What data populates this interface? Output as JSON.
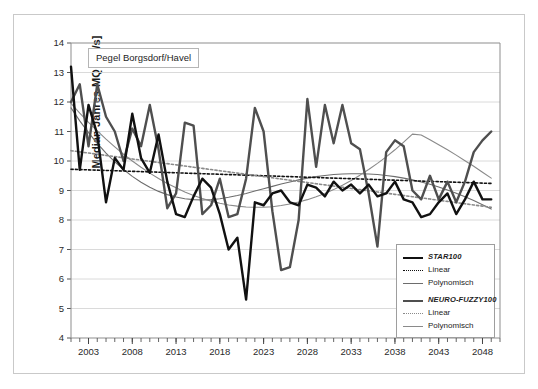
{
  "figure": {
    "title_box": "Pegel Borgsdorf/Havel",
    "frame_color": "#c9c9c9",
    "background": "#ffffff"
  },
  "legend": {
    "items": [
      {
        "key": "star-solid",
        "label": "STAR100",
        "style": "bold-italic",
        "color": "#111111"
      },
      {
        "key": "star-linear",
        "label": "Linear",
        "style": "normal",
        "color": "#111111"
      },
      {
        "key": "star-poly",
        "label": "Polynomisch",
        "style": "normal",
        "color": "#6d6d6d"
      },
      {
        "key": "nf-solid",
        "label": "NEURO-FUZZY100",
        "style": "bold-italic",
        "color": "#4f4f4f"
      },
      {
        "key": "nf-linear",
        "label": "Linear",
        "style": "normal",
        "color": "#8a8a8a"
      },
      {
        "key": "nf-poly",
        "label": "Polynomisch",
        "style": "normal",
        "color": "#8a8a8a"
      }
    ]
  },
  "chart_data": {
    "type": "line",
    "title": "Pegel Borgsdorf/Havel",
    "xlabel": "",
    "ylabel": "Median Jahres-MQ [m³/s]",
    "xlim": [
      2001,
      2050
    ],
    "ylim": [
      4,
      14
    ],
    "yticks": [
      4,
      5,
      6,
      7,
      8,
      9,
      10,
      11,
      12,
      13,
      14
    ],
    "xticks_major": [
      2003,
      2008,
      2013,
      2018,
      2023,
      2028,
      2033,
      2038,
      2043,
      2048
    ],
    "xtick_minor_step": 1,
    "grid": "horizontal",
    "legend_position": "lower-right",
    "x": [
      2001,
      2002,
      2003,
      2004,
      2005,
      2006,
      2007,
      2008,
      2009,
      2010,
      2011,
      2012,
      2013,
      2014,
      2015,
      2016,
      2017,
      2018,
      2019,
      2020,
      2021,
      2022,
      2023,
      2024,
      2025,
      2026,
      2027,
      2028,
      2029,
      2030,
      2031,
      2032,
      2033,
      2034,
      2035,
      2036,
      2037,
      2038,
      2039,
      2040,
      2041,
      2042,
      2043,
      2044,
      2045,
      2046,
      2047,
      2048,
      2049
    ],
    "series": [
      {
        "name": "STAR100",
        "style": "solid",
        "width": 2.4,
        "color": "#111111",
        "values": [
          13.2,
          9.7,
          11.9,
          10.9,
          8.6,
          10.1,
          9.7,
          11.6,
          10.1,
          9.6,
          10.9,
          9.3,
          8.2,
          8.1,
          8.8,
          9.4,
          9.1,
          8.2,
          7.0,
          7.4,
          5.3,
          8.6,
          8.5,
          8.9,
          9.0,
          8.6,
          8.5,
          9.2,
          9.1,
          8.8,
          9.3,
          9.0,
          9.2,
          8.9,
          9.2,
          8.8,
          8.9,
          9.3,
          8.7,
          8.6,
          8.1,
          8.2,
          8.6,
          8.9,
          8.2,
          8.7,
          9.3,
          8.7,
          8.7
        ]
      },
      {
        "name": "NEURO-FUZZY100",
        "style": "solid",
        "width": 2.4,
        "color": "#4f4f4f",
        "values": [
          12.0,
          12.6,
          10.5,
          12.6,
          11.5,
          11.0,
          10.0,
          11.1,
          10.5,
          11.9,
          10.4,
          8.4,
          8.9,
          11.3,
          11.2,
          8.2,
          8.5,
          9.4,
          8.1,
          8.2,
          9.4,
          11.8,
          11.0,
          8.3,
          6.3,
          6.4,
          8.0,
          12.1,
          9.8,
          11.9,
          10.6,
          11.9,
          10.6,
          10.4,
          8.9,
          7.1,
          10.3,
          10.7,
          10.5,
          9.0,
          8.7,
          9.5,
          8.7,
          9.3,
          8.6,
          9.3,
          10.3,
          10.7,
          11.0
        ]
      },
      {
        "name": "STAR100 Linear",
        "style": "dotted",
        "width": 1.6,
        "color": "#111111",
        "values": [
          9.72,
          9.71,
          9.7,
          9.69,
          9.68,
          9.67,
          9.66,
          9.65,
          9.64,
          9.63,
          9.62,
          9.61,
          9.6,
          9.59,
          9.58,
          9.57,
          9.56,
          9.55,
          9.54,
          9.53,
          9.52,
          9.51,
          9.5,
          9.49,
          9.48,
          9.47,
          9.46,
          9.45,
          9.44,
          9.43,
          9.42,
          9.41,
          9.4,
          9.39,
          9.38,
          9.37,
          9.36,
          9.35,
          9.34,
          9.33,
          9.32,
          9.31,
          9.3,
          9.29,
          9.28,
          9.27,
          9.26,
          9.25,
          9.24
        ]
      },
      {
        "name": "STAR100 Polynomisch",
        "style": "solid",
        "width": 1.1,
        "color": "#6d6d6d",
        "values": [
          11.8,
          11.36,
          10.96,
          10.6,
          10.27,
          9.97,
          9.71,
          9.48,
          9.28,
          9.11,
          8.97,
          8.86,
          8.78,
          8.72,
          8.69,
          8.68,
          8.69,
          8.72,
          8.77,
          8.83,
          8.9,
          8.98,
          9.06,
          9.14,
          9.22,
          9.29,
          9.36,
          9.42,
          9.47,
          9.51,
          9.54,
          9.56,
          9.57,
          9.57,
          9.56,
          9.54,
          9.51,
          9.47,
          9.42,
          9.36,
          9.29,
          9.21,
          9.12,
          9.02,
          8.91,
          8.79,
          8.66,
          8.52,
          8.37
        ]
      },
      {
        "name": "NEURO-FUZZY100 Linear",
        "style": "dotted",
        "width": 1.6,
        "color": "#8a8a8a",
        "values": [
          10.35,
          10.31,
          10.27,
          10.23,
          10.19,
          10.15,
          10.11,
          10.07,
          10.03,
          9.99,
          9.95,
          9.91,
          9.87,
          9.83,
          9.79,
          9.75,
          9.71,
          9.67,
          9.63,
          9.59,
          9.55,
          9.51,
          9.47,
          9.43,
          9.39,
          9.35,
          9.31,
          9.27,
          9.23,
          9.19,
          9.15,
          9.11,
          9.07,
          9.03,
          8.99,
          8.95,
          8.91,
          8.87,
          8.83,
          8.79,
          8.75,
          8.71,
          8.67,
          8.63,
          8.59,
          8.55,
          8.51,
          8.47,
          8.43
        ]
      },
      {
        "name": "NEURO-FUZZY100 Polynomisch",
        "style": "solid",
        "width": 1.1,
        "color": "#8a8a8a",
        "values": [
          11.95,
          11.62,
          11.31,
          11.02,
          10.74,
          10.48,
          10.23,
          10.0,
          9.79,
          9.59,
          9.41,
          9.24,
          9.09,
          8.95,
          8.83,
          8.73,
          8.64,
          8.57,
          8.51,
          8.47,
          8.44,
          8.43,
          8.43,
          8.45,
          8.49,
          8.54,
          8.61,
          8.69,
          8.79,
          8.9,
          9.03,
          9.18,
          9.34,
          9.52,
          9.71,
          9.92,
          10.14,
          10.38,
          10.64,
          10.91,
          10.88,
          10.72,
          10.55,
          10.38,
          10.2,
          10.01,
          9.82,
          9.62,
          9.42
        ]
      }
    ]
  }
}
